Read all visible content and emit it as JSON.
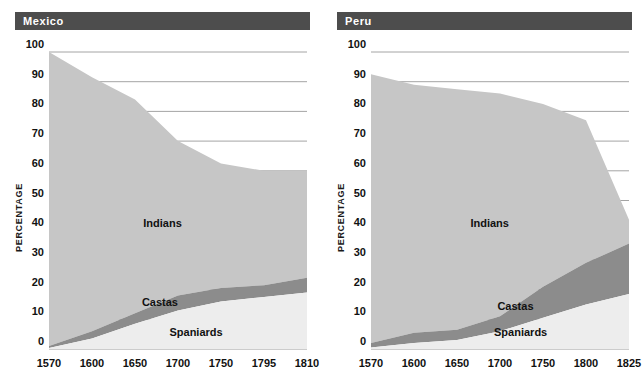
{
  "figure": {
    "y_axis_title": "PERCENTAGE",
    "colors": {
      "title_bar": "#4d4d4d",
      "title_text": "#ffffff",
      "indians": "#c6c6c6",
      "castas": "#8c8c8c",
      "spaniards": "#ededed",
      "gridline": "#9a9a9a",
      "text": "#111111",
      "background": "#ffffff"
    }
  },
  "chart_data": [
    {
      "type": "area",
      "title": "Mexico",
      "xlabel": "",
      "ylabel": "PERCENTAGE",
      "ylim": [
        0,
        100
      ],
      "yticks": [
        0,
        10,
        20,
        30,
        40,
        50,
        60,
        70,
        80,
        90,
        100
      ],
      "grid": true,
      "stacked": true,
      "legend": "inline-labels",
      "categories": [
        "1570",
        "1600",
        "1650",
        "1700",
        "1750",
        "1795",
        "1810"
      ],
      "x": [
        1570,
        1600,
        1650,
        1700,
        1750,
        1795,
        1810
      ],
      "series": [
        {
          "name": "Spaniards",
          "values": [
            0.3,
            3.5,
            8.5,
            13.0,
            16.0,
            17.5,
            19.0
          ]
        },
        {
          "name": "Castas",
          "values": [
            0.7,
            2.5,
            3.5,
            5.0,
            4.5,
            4.0,
            5.0
          ]
        },
        {
          "name": "Indians",
          "values": [
            99.0,
            85.5,
            72.0,
            52.0,
            42.0,
            38.5,
            36.0
          ]
        }
      ],
      "cumulative_top": {
        "spaniards": [
          0.3,
          3.5,
          8.5,
          13.0,
          16.0,
          17.5,
          19.0
        ],
        "castas": [
          1.0,
          6.0,
          12.0,
          18.0,
          20.5,
          21.5,
          24.0
        ],
        "indians": [
          100.0,
          91.5,
          84.0,
          70.0,
          62.5,
          60.0,
          60.0
        ]
      },
      "annotations": [
        {
          "text": "Indians",
          "value_band": "indians"
        },
        {
          "text": "Castas",
          "value_band": "castas"
        },
        {
          "text": "Spaniards",
          "value_band": "spaniards"
        }
      ]
    },
    {
      "type": "area",
      "title": "Peru",
      "xlabel": "",
      "ylabel": "PERCENTAGE",
      "ylim": [
        0,
        100
      ],
      "yticks": [
        0,
        10,
        20,
        30,
        40,
        50,
        60,
        70,
        80,
        90,
        100
      ],
      "grid": true,
      "stacked": true,
      "legend": "inline-labels",
      "categories": [
        "1570",
        "1600",
        "1650",
        "1700",
        "1750",
        "1800",
        "1825"
      ],
      "x": [
        1570,
        1600,
        1650,
        1700,
        1750,
        1800,
        1825
      ],
      "series": [
        {
          "name": "Spaniards",
          "values": [
            0.5,
            2.0,
            3.0,
            6.0,
            10.5,
            15.0,
            18.5
          ]
        },
        {
          "name": "Castas",
          "values": [
            1.5,
            3.5,
            3.5,
            5.0,
            10.5,
            14.0,
            17.0
          ]
        },
        {
          "name": "Indians",
          "values": [
            90.5,
            83.5,
            81.0,
            75.0,
            61.5,
            48.0,
            8.0
          ]
        }
      ],
      "cumulative_top": {
        "spaniards": [
          0.5,
          2.0,
          3.0,
          6.0,
          10.5,
          15.0,
          18.5
        ],
        "castas": [
          2.0,
          5.5,
          6.5,
          11.0,
          21.0,
          29.0,
          35.5
        ],
        "indians": [
          92.5,
          89.0,
          87.5,
          86.0,
          82.5,
          77.0,
          43.5
        ]
      },
      "annotations": [
        {
          "text": "Indians",
          "value_band": "indians"
        },
        {
          "text": "Castas",
          "value_band": "castas"
        },
        {
          "text": "Spaniards",
          "value_band": "spaniards"
        }
      ]
    }
  ]
}
